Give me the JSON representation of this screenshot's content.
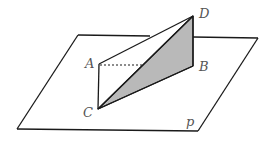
{
  "diagram": {
    "type": "3d-geometry",
    "labels": {
      "A": "A",
      "B": "B",
      "C": "C",
      "D": "D",
      "plane": "p"
    },
    "colors": {
      "stroke": "#1a1a1a",
      "shade": "#b9b9b9",
      "label": "#555555",
      "background": "#ffffff"
    },
    "edges": [
      {
        "from": "A",
        "to": "D",
        "style": "solid"
      },
      {
        "from": "A",
        "to": "C",
        "style": "solid"
      },
      {
        "from": "A",
        "to": "BCD",
        "style": "dashed"
      },
      {
        "from": "C",
        "to": "D",
        "style": "solid"
      },
      {
        "from": "C",
        "to": "B",
        "style": "solid"
      },
      {
        "from": "D",
        "to": "B",
        "style": "solid"
      }
    ],
    "shaded_face": [
      "B",
      "C",
      "D"
    ]
  }
}
